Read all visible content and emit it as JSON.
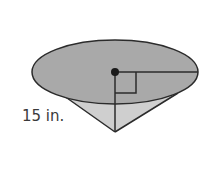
{
  "figure": {
    "shape": "cone",
    "slant_height_label": "15 in.",
    "colors": {
      "base_fill": "#a9a9a9",
      "lateral_fill": "#cfcfcf",
      "stroke": "#2b2b2b",
      "label": "#3a3a3a"
    }
  }
}
